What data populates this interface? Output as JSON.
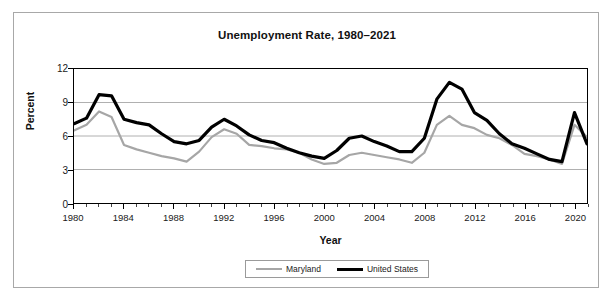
{
  "chart_data": {
    "type": "line",
    "title": "Unemployment Rate, 1980–2021",
    "xlabel": "Year",
    "ylabel": "Percent",
    "xlim": [
      1980,
      2021
    ],
    "ylim": [
      0,
      12
    ],
    "yticks": [
      0,
      3,
      6,
      9,
      12
    ],
    "ytick_labels": [
      "0",
      "3",
      "6",
      "9",
      "12"
    ],
    "xticks": [
      1980,
      1984,
      1988,
      1992,
      1996,
      2000,
      2004,
      2008,
      2012,
      2016,
      2020
    ],
    "xtick_labels": [
      "1980",
      "1984",
      "1988",
      "1992",
      "1996",
      "2000",
      "2004",
      "2008",
      "2012",
      "2016",
      "2020"
    ],
    "x_minor_tick_interval": 1,
    "grid": "horizontal",
    "grid_color": "#b0b0b0",
    "legend_position": "bottom",
    "x": [
      1980,
      1981,
      1982,
      1983,
      1984,
      1985,
      1986,
      1987,
      1988,
      1989,
      1990,
      1991,
      1992,
      1993,
      1994,
      1995,
      1996,
      1997,
      1998,
      1999,
      2000,
      2001,
      2002,
      2003,
      2004,
      2005,
      2006,
      2007,
      2008,
      2009,
      2010,
      2011,
      2012,
      2013,
      2014,
      2015,
      2016,
      2017,
      2018,
      2019,
      2020,
      2021
    ],
    "series": [
      {
        "name": "Maryland",
        "color": "#a6a6a6",
        "width": 2.2,
        "values": [
          6.5,
          7.0,
          8.2,
          7.7,
          5.2,
          4.8,
          4.5,
          4.2,
          4.0,
          3.7,
          4.6,
          5.9,
          6.6,
          6.2,
          5.2,
          5.1,
          4.9,
          4.8,
          4.5,
          3.9,
          3.5,
          3.6,
          4.3,
          4.5,
          4.3,
          4.1,
          3.9,
          3.6,
          4.5,
          7.0,
          7.8,
          7.0,
          6.7,
          6.1,
          5.8,
          5.2,
          4.4,
          4.2,
          3.9,
          3.5,
          7.0,
          5.9
        ]
      },
      {
        "name": "United States",
        "color": "#000000",
        "width": 3.2,
        "values": [
          7.1,
          7.6,
          9.7,
          9.6,
          7.5,
          7.2,
          7.0,
          6.2,
          5.5,
          5.3,
          5.6,
          6.8,
          7.5,
          6.9,
          6.1,
          5.6,
          5.4,
          4.9,
          4.5,
          4.2,
          4.0,
          4.7,
          5.8,
          6.0,
          5.5,
          5.1,
          4.6,
          4.6,
          5.8,
          9.3,
          10.8,
          10.2,
          8.1,
          7.4,
          6.2,
          5.3,
          4.9,
          4.4,
          3.9,
          3.7,
          8.1,
          5.3
        ]
      }
    ]
  },
  "legend": {
    "entries": [
      {
        "label": "Maryland"
      },
      {
        "label": "United States"
      }
    ]
  }
}
